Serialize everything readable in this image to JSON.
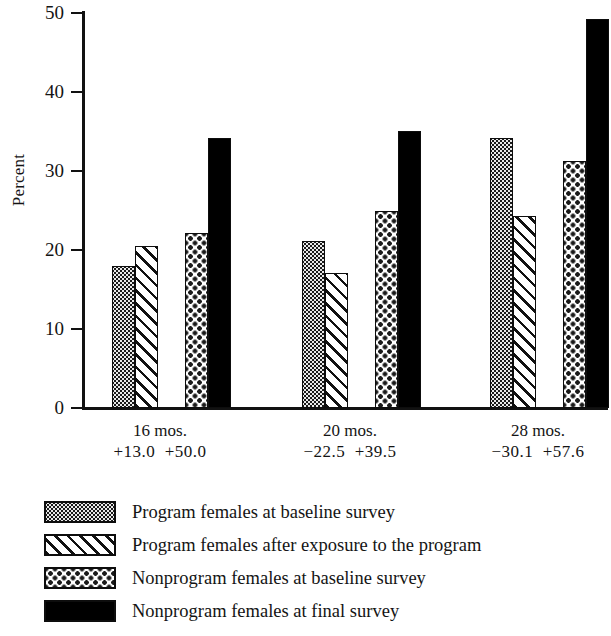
{
  "chart_data": {
    "type": "bar",
    "title": "",
    "xlabel": "",
    "ylabel": "Percent",
    "ylim": [
      0,
      50
    ],
    "yticks": [
      0,
      10,
      20,
      30,
      40,
      50
    ],
    "grid": false,
    "legend_position": "bottom-left",
    "categories": [
      "16 mos.",
      "20 mos.",
      "28 mos."
    ],
    "category_sublabels": [
      "+13.0  +50.0",
      "−22.5  +39.5",
      "−30.1  +57.6"
    ],
    "series": [
      {
        "name": "Program females at baseline survey",
        "pattern": "dense-dot",
        "color": "#e9e9e9",
        "values": [
          18.0,
          21.2,
          34.2
        ]
      },
      {
        "name": "Program females after exposure to the program",
        "pattern": "diagonal-hatch",
        "color": "#ffffff",
        "values": [
          20.5,
          17.1,
          24.3
        ]
      },
      {
        "name": "Nonprogram females at baseline survey",
        "pattern": "sparse-dot",
        "color": "#ffffff",
        "values": [
          22.1,
          25.0,
          31.3
        ]
      },
      {
        "name": "Nonprogram females at final survey",
        "pattern": "solid-black",
        "color": "#000000",
        "values": [
          34.2,
          35.1,
          49.3
        ]
      }
    ]
  },
  "axis": {
    "y_label": "Percent",
    "y_tick_labels": [
      "50",
      "40",
      "30",
      "20",
      "10",
      "0"
    ]
  },
  "x_groups": [
    {
      "line1": "16 mos.",
      "line2": "+13.0  +50.0"
    },
    {
      "line1": "20 mos.",
      "line2": "−22.5  +39.5"
    },
    {
      "line1": "28 mos.",
      "line2": "−30.1  +57.6"
    }
  ],
  "legend": [
    {
      "label": "Program females at baseline survey",
      "pattern": "dense-dot"
    },
    {
      "label": "Program females after exposure to the program",
      "pattern": "diagonal-hatch"
    },
    {
      "label": "Nonprogram females at baseline survey",
      "pattern": "sparse-dot"
    },
    {
      "label": "Nonprogram females at final survey",
      "pattern": "solid-black"
    }
  ]
}
